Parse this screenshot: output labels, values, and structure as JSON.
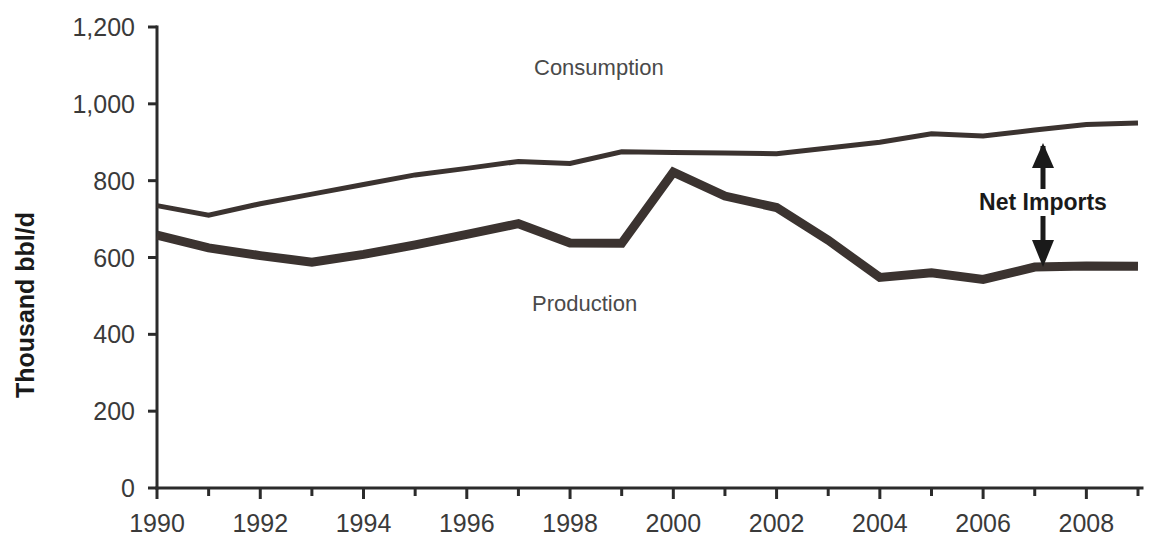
{
  "chart_data": {
    "type": "line",
    "title": "",
    "subtitle": "",
    "xlabel": "",
    "ylabel": "Thousand bbl/d",
    "xlim": [
      1990,
      2009
    ],
    "ylim": [
      0,
      1200
    ],
    "grid": false,
    "legend_position": "inline-annotations",
    "x": [
      1990,
      1991,
      1992,
      1993,
      1994,
      1995,
      1996,
      1997,
      1998,
      1999,
      2000,
      2001,
      2002,
      2003,
      2004,
      2005,
      2006,
      2007,
      2008,
      2009
    ],
    "xtick_labels": [
      "1990",
      "1992",
      "1994",
      "1996",
      "1998",
      "2000",
      "2002",
      "2004",
      "2006",
      "2008"
    ],
    "xtick_values": [
      1990,
      1992,
      1994,
      1996,
      1998,
      2000,
      2002,
      2004,
      2006,
      2008
    ],
    "ytick_labels": [
      "0",
      "200",
      "400",
      "600",
      "800",
      "1,000",
      "1,200"
    ],
    "ytick_values": [
      0,
      200,
      400,
      600,
      800,
      1000,
      1200
    ],
    "series": [
      {
        "name": "Consumption",
        "label": "Consumption",
        "color": "#3b3330",
        "line_width": "thin",
        "values": [
          735,
          710,
          740,
          765,
          790,
          815,
          832,
          850,
          845,
          875,
          873,
          872,
          870,
          885,
          900,
          922,
          916,
          932,
          946,
          950
        ]
      },
      {
        "name": "Production",
        "label": "Production",
        "color": "#3b3330",
        "line_width": "thick",
        "values": [
          658,
          625,
          605,
          588,
          608,
          633,
          660,
          688,
          638,
          637,
          822,
          760,
          730,
          645,
          548,
          560,
          543,
          575,
          578,
          577
        ]
      }
    ],
    "annotations": [
      {
        "name": "net-imports",
        "text": "Net Imports",
        "description": "Vertical double arrow between Production and Consumption lines near 2007"
      }
    ]
  },
  "labels": {
    "y_axis_title": "Thousand bbl/d",
    "consumption": "Consumption",
    "production": "Production",
    "net_imports": "Net Imports"
  },
  "axis": {
    "y_ticks": [
      "1,200",
      "1,000",
      "800",
      "600",
      "400",
      "200",
      "0"
    ],
    "x_ticks": [
      "1990",
      "1992",
      "1994",
      "1996",
      "1998",
      "2000",
      "2002",
      "2004",
      "2006",
      "2008"
    ]
  },
  "colors": {
    "line": "#3b3330",
    "axis": "#2b2b2b",
    "tick_text": "#3a3a3a",
    "title_text": "#1a1a1a",
    "background": "#ffffff"
  }
}
